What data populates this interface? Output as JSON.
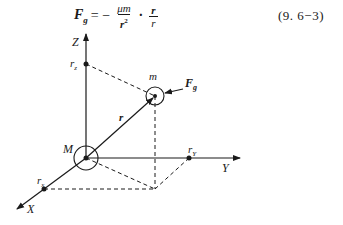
{
  "equation": {
    "lhs": "F",
    "lhs_subscript": "g",
    "equals_minus": "= −",
    "fraction1_numerator": "μm",
    "fraction1_denominator": "r",
    "fraction1_den_exponent": "2",
    "dot": "·",
    "fraction2_numerator": "r",
    "fraction2_denominator": "r",
    "number": "(9. 6−3)"
  },
  "diagram": {
    "axes": {
      "z_label": "Z",
      "y_label": "Y",
      "x_label": "X"
    },
    "points": {
      "central_mass_label": "M",
      "orbiting_mass_label": "m",
      "force_label": "F",
      "force_subscript": "g",
      "position_vector_label": "r",
      "rz_label": "r",
      "rz_sub": "z",
      "ry_label": "r",
      "ry_sub": "Y",
      "rx_label": "r",
      "rx_sub": "x"
    },
    "colors": {
      "ink": "#1a1a1a",
      "background": "#ffffff"
    }
  }
}
